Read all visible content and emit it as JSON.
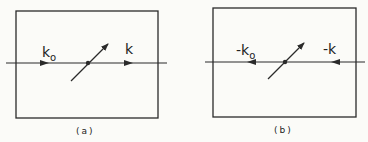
{
  "figure": {
    "panels": [
      {
        "id": "a",
        "caption": "(a)",
        "incoming_label": "k",
        "incoming_sub": "o",
        "outgoing_label": "k",
        "direction": "right"
      },
      {
        "id": "b",
        "caption": "(b)",
        "incoming_label": "-k",
        "incoming_sub": "o",
        "outgoing_label": "-k",
        "direction": "left"
      }
    ],
    "colors": {
      "line": "#2a2a2a",
      "background": "#fbfbf8"
    }
  }
}
